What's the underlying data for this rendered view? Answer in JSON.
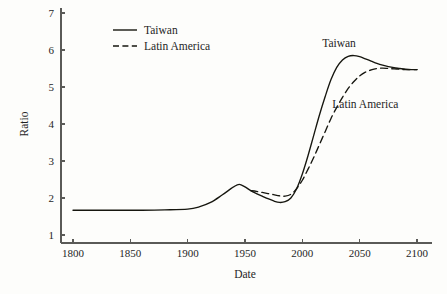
{
  "chart_data": {
    "type": "line",
    "title": "",
    "xlabel": "Date",
    "ylabel": "Ratio",
    "xlim": [
      1790,
      2110
    ],
    "ylim": [
      0.8,
      7.2
    ],
    "xticks": [
      1800,
      1850,
      1900,
      1950,
      2000,
      2050,
      2100
    ],
    "xtick_labels": [
      "1800",
      "1850",
      "1900",
      "1950",
      "2000",
      "2050",
      "2100"
    ],
    "yticks": [
      1,
      2,
      3,
      4,
      5,
      6,
      7
    ],
    "ytick_labels": [
      "1",
      "2",
      "3",
      "4",
      "5",
      "6",
      "7"
    ],
    "grid": false,
    "legend_position": "top-left-inside",
    "series": [
      {
        "name": "Taiwan",
        "style": "solid",
        "color": "#16160f",
        "x": [
          1800,
          1820,
          1840,
          1860,
          1880,
          1900,
          1910,
          1920,
          1930,
          1940,
          1945,
          1950,
          1955,
          1960,
          1965,
          1970,
          1975,
          1980,
          1985,
          1990,
          1995,
          2000,
          2005,
          2010,
          2015,
          2020,
          2025,
          2030,
          2035,
          2040,
          2045,
          2050,
          2055,
          2060,
          2065,
          2070,
          2075,
          2080,
          2085,
          2090,
          2095,
          2100
        ],
        "y": [
          1.67,
          1.67,
          1.67,
          1.67,
          1.68,
          1.7,
          1.76,
          1.88,
          2.08,
          2.3,
          2.37,
          2.3,
          2.2,
          2.12,
          2.05,
          1.98,
          1.92,
          1.88,
          1.9,
          2.0,
          2.25,
          2.65,
          3.15,
          3.7,
          4.25,
          4.75,
          5.2,
          5.53,
          5.73,
          5.83,
          5.85,
          5.82,
          5.76,
          5.7,
          5.64,
          5.59,
          5.55,
          5.52,
          5.5,
          5.48,
          5.47,
          5.47
        ]
      },
      {
        "name": "Latin America",
        "style": "dashed",
        "color": "#16160f",
        "x": [
          1955,
          1960,
          1965,
          1970,
          1975,
          1980,
          1985,
          1990,
          1995,
          2000,
          2005,
          2010,
          2015,
          2020,
          2025,
          2030,
          2035,
          2040,
          2045,
          2050,
          2055,
          2060,
          2065,
          2070,
          2075,
          2080,
          2085,
          2090,
          2095,
          2100
        ],
        "y": [
          2.2,
          2.18,
          2.15,
          2.12,
          2.09,
          2.06,
          2.05,
          2.1,
          2.25,
          2.48,
          2.78,
          3.1,
          3.45,
          3.8,
          4.15,
          4.45,
          4.72,
          4.96,
          5.15,
          5.3,
          5.4,
          5.46,
          5.5,
          5.51,
          5.5,
          5.49,
          5.48,
          5.47,
          5.47,
          5.47
        ]
      }
    ],
    "annotations": [
      {
        "text": "Taiwan",
        "x": 2032,
        "y": 6.08
      },
      {
        "text": "Latin America",
        "x": 2055,
        "y": 4.42
      }
    ],
    "legend": [
      {
        "label": "Taiwan",
        "style": "solid"
      },
      {
        "label": "Latin America",
        "style": "dashed"
      }
    ]
  }
}
